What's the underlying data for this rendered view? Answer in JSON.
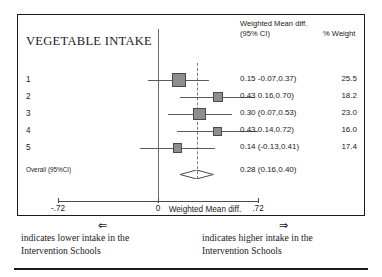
{
  "figure": {
    "outcome_title": "VEGETABLE INTAKE",
    "headers": {
      "estimate_line1": "Weighted Mean diff.",
      "estimate_line2": "(95% CI)",
      "weight": "% Weight"
    },
    "axis": {
      "title": "Weighted Mean diff.",
      "ticks": [
        "-.72",
        "0",
        ".72"
      ],
      "tick_values": [
        -0.72,
        0,
        0.72
      ]
    },
    "overall": {
      "label": "Overall (95%CI)",
      "estimate_text": "0.28 (0.16,0.40)"
    },
    "footer": {
      "left_arrow": "⇐",
      "left_line1": "indicates lower intake in the",
      "left_line2": "Intervention Schools",
      "right_arrow": "⇒",
      "right_line1": "indicates higher intake in the",
      "right_line2": "Intervention Schools"
    }
  },
  "chart_data": {
    "type": "forest",
    "title": "VEGETABLE INTAKE",
    "xlabel": "Weighted Mean diff.",
    "ylabel": "",
    "xlim": [
      -0.72,
      0.72
    ],
    "xticks": [
      -0.72,
      0,
      0.72
    ],
    "xticklabels": [
      "-.72",
      "0",
      ".72"
    ],
    "null_value": 0,
    "grid": false,
    "legend": "none",
    "effect_measure": "Weighted Mean difference (95% CI)",
    "studies": [
      {
        "label": "1",
        "estimate": 0.15,
        "ci_low": -0.07,
        "ci_high": 0.37,
        "estimate_text": "0.15 -0.07,0.37)",
        "weight": 25.5,
        "weight_text": "25.5"
      },
      {
        "label": "2",
        "estimate": 0.43,
        "ci_low": 0.16,
        "ci_high": 0.7,
        "estimate_text": "0.43 0.16,0.70)",
        "weight": 18.2,
        "weight_text": "18.2"
      },
      {
        "label": "3",
        "estimate": 0.3,
        "ci_low": 0.07,
        "ci_high": 0.53,
        "estimate_text": "0.30 (0.07,0.53)",
        "weight": 23.0,
        "weight_text": "23.0"
      },
      {
        "label": "4",
        "estimate": 0.43,
        "ci_low": 0.14,
        "ci_high": 0.72,
        "estimate_text": "0.43 0.14,0.72)",
        "weight": 16.0,
        "weight_text": "16.0"
      },
      {
        "label": "5",
        "estimate": 0.14,
        "ci_low": -0.13,
        "ci_high": 0.41,
        "estimate_text": "0.14 (-0.13,0.41)",
        "weight": 17.4,
        "weight_text": "17.4"
      }
    ],
    "pooled": {
      "label": "Overall (95%CI)",
      "estimate": 0.28,
      "ci_low": 0.16,
      "ci_high": 0.4,
      "estimate_text": "0.28 (0.16,0.40)"
    }
  }
}
